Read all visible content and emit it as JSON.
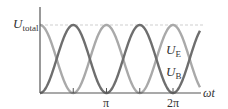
{
  "diagram": {
    "y_axis_label": {
      "main": "U",
      "sub": "total"
    },
    "x_axis_label": "ωt",
    "x_ticks": [
      {
        "value": "π/2",
        "label": ""
      },
      {
        "value": "π",
        "label": "π"
      },
      {
        "value": "3π/2",
        "label": ""
      },
      {
        "value": "2π",
        "label": "2π"
      }
    ],
    "curves": [
      {
        "name": "U_E",
        "label_main": "U",
        "label_sub": "E",
        "function": "U_total·cos²(ωt)",
        "color": "#a9a9a9"
      },
      {
        "name": "U_B",
        "label_main": "U",
        "label_sub": "B",
        "function": "U_total·sin²(ωt)",
        "color": "#6e6e6e"
      }
    ],
    "reference_line": {
      "name": "U_total level",
      "style": "dashed",
      "color": "#cfcfcf"
    },
    "axis_color": "#555555"
  }
}
